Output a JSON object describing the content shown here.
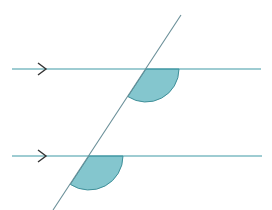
{
  "diagram": {
    "colors": {
      "line": "#3f9aa6",
      "transversal": "#6a8f98",
      "arrow": "#333333",
      "angle_fill": "#6fbcc6",
      "angle_stroke": "#3f8f99",
      "background": "#ffffff"
    },
    "parallel_lines": [
      {
        "name": "top",
        "x1": 12,
        "y": 69,
        "x2": 261,
        "arrow_x": 46
      },
      {
        "name": "bottom",
        "x1": 12,
        "y": 156,
        "x2": 262,
        "arrow_x": 46
      }
    ],
    "transversal": {
      "x1": 181,
      "y1": 15,
      "x2": 53,
      "y2": 210
    },
    "angles": [
      {
        "name": "top-angle",
        "cx": 146,
        "cy": 69,
        "r": 33
      },
      {
        "name": "bottom-angle",
        "cx": 89,
        "cy": 156,
        "r": 34
      }
    ]
  }
}
